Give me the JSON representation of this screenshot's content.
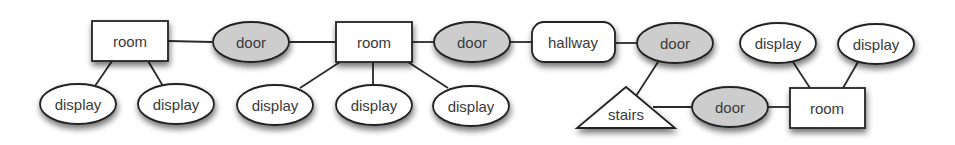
{
  "diagram": {
    "colors": {
      "door_fill": "#cdcdcd",
      "node_fill": "#ffffff",
      "stroke": "#222222"
    },
    "nodes": [
      {
        "id": "room1",
        "type": "room",
        "label": "room"
      },
      {
        "id": "door1",
        "type": "door",
        "label": "door"
      },
      {
        "id": "room2",
        "type": "room",
        "label": "room"
      },
      {
        "id": "door2",
        "type": "door",
        "label": "door"
      },
      {
        "id": "hallway",
        "type": "hallway",
        "label": "hallway"
      },
      {
        "id": "door3",
        "type": "door",
        "label": "door"
      },
      {
        "id": "stairs",
        "type": "stairs",
        "label": "stairs"
      },
      {
        "id": "door4",
        "type": "door",
        "label": "door"
      },
      {
        "id": "room3",
        "type": "room",
        "label": "room"
      },
      {
        "id": "display1",
        "type": "display",
        "label": "display"
      },
      {
        "id": "display2",
        "type": "display",
        "label": "display"
      },
      {
        "id": "display3",
        "type": "display",
        "label": "display"
      },
      {
        "id": "display4",
        "type": "display",
        "label": "display"
      },
      {
        "id": "display5",
        "type": "display",
        "label": "display"
      },
      {
        "id": "display6",
        "type": "display",
        "label": "display"
      },
      {
        "id": "display7",
        "type": "display",
        "label": "display"
      }
    ],
    "edges": [
      [
        "room1",
        "door1"
      ],
      [
        "door1",
        "room2"
      ],
      [
        "room2",
        "door2"
      ],
      [
        "door2",
        "hallway"
      ],
      [
        "hallway",
        "door3"
      ],
      [
        "door3",
        "stairs"
      ],
      [
        "stairs",
        "door4"
      ],
      [
        "door4",
        "room3"
      ],
      [
        "room1",
        "display1"
      ],
      [
        "room1",
        "display2"
      ],
      [
        "room2",
        "display3"
      ],
      [
        "room2",
        "display4"
      ],
      [
        "room2",
        "display5"
      ],
      [
        "room3",
        "display6"
      ],
      [
        "room3",
        "display7"
      ]
    ]
  }
}
